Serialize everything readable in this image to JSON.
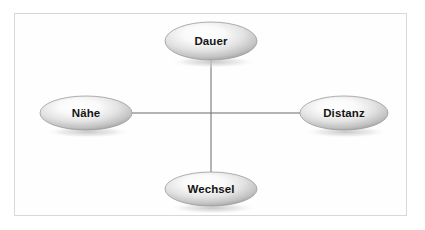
{
  "diagram": {
    "frame": {
      "border_color": "#d8d8d8",
      "background_color": "#fefefe"
    },
    "style": {
      "node_fill_light": "#ffffff",
      "node_fill_mid": "#d5d5d5",
      "node_fill_dark": "#8c8c8c",
      "node_stroke": "#9a9a9a",
      "connector_color": "#6b6b6b",
      "label_color": "#141414",
      "shadow_color": "#c9c9c9"
    },
    "nodes": [
      {
        "id": "dauer",
        "label": "Dauer",
        "position": "top",
        "cx": 211,
        "cy": 41,
        "rx": 46,
        "ry": 19
      },
      {
        "id": "naehe",
        "label": "Nähe",
        "position": "left",
        "cx": 86,
        "cy": 113,
        "rx": 46,
        "ry": 17
      },
      {
        "id": "distanz",
        "label": "Distanz",
        "position": "right",
        "cx": 344,
        "cy": 113,
        "rx": 44,
        "ry": 17
      },
      {
        "id": "wechsel",
        "label": "Wechsel",
        "position": "bottom",
        "cx": 211,
        "cy": 189,
        "rx": 46,
        "ry": 17
      }
    ],
    "connectors": [
      {
        "id": "horizontal-axis",
        "from": "naehe",
        "to": "distanz",
        "x1": 132,
        "y1": 113,
        "x2": 300,
        "y2": 113
      },
      {
        "id": "vertical-axis",
        "from": "dauer",
        "to": "wechsel",
        "x1": 211,
        "y1": 60,
        "x2": 211,
        "y2": 172
      }
    ]
  }
}
